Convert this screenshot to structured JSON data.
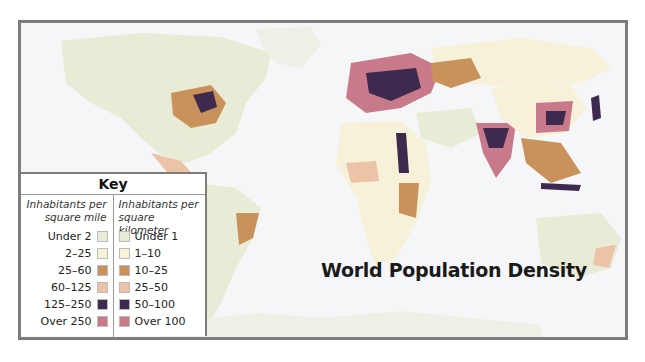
{
  "title": "World Population Density",
  "key": {
    "title": "Key",
    "left_header": "Inhabitants per square mile",
    "right_header": "Inhabitants per square kilometer",
    "categories": [
      {
        "mile": "Under 2",
        "km": "Under 1",
        "color": "#e8ecd6"
      },
      {
        "mile": "2–25",
        "km": "1–10",
        "color": "#f6f1d8"
      },
      {
        "mile": "25–60",
        "km": "10–25",
        "color": "#c9925a"
      },
      {
        "mile": "60–125",
        "km": "25–50",
        "color": "#ebc3a6"
      },
      {
        "mile": "125–250",
        "km": "50–100",
        "color": "#3e2a4e"
      },
      {
        "mile": "Over 250",
        "km": "Over 100",
        "color": "#c97a8a"
      }
    ]
  },
  "colors": {
    "ocean": "#f4f6f8",
    "frame": "#7d7d7d"
  }
}
